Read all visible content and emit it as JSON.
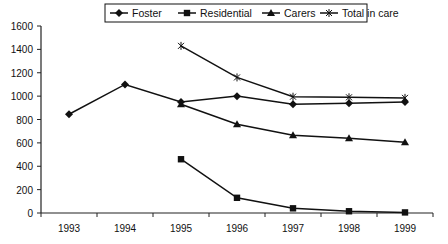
{
  "chart_data": {
    "type": "line",
    "title": "",
    "xlabel": "",
    "ylabel": "",
    "categories": [
      "1993",
      "1994",
      "1995",
      "1996",
      "1997",
      "1998",
      "1999"
    ],
    "ylim": [
      0,
      1600
    ],
    "yticks": [
      0,
      200,
      400,
      600,
      800,
      1000,
      1200,
      1400,
      1600
    ],
    "grid": false,
    "legend_position": "top",
    "series": [
      {
        "name": "Foster",
        "marker": "diamond",
        "values": [
          845,
          1100,
          950,
          1000,
          930,
          940,
          950
        ]
      },
      {
        "name": "Residential",
        "marker": "square",
        "values": [
          null,
          null,
          460,
          130,
          40,
          15,
          5
        ]
      },
      {
        "name": "Carers",
        "marker": "triangle",
        "values": [
          null,
          null,
          930,
          760,
          665,
          640,
          605
        ]
      },
      {
        "name": "Total in care",
        "marker": "x-cross",
        "values": [
          null,
          null,
          1430,
          1160,
          995,
          990,
          985
        ]
      }
    ]
  },
  "legend": {
    "items": [
      "Foster",
      "Residential",
      "Carers",
      "Total in care"
    ]
  }
}
